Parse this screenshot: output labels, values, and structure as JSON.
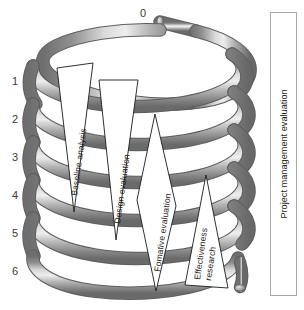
{
  "figure": {
    "background_color": "#ffffff",
    "coil": {
      "name": "helical-coil",
      "turns": 6,
      "tube_color_dark": "#6f6f6f",
      "tube_color_mid": "#9a9a9a",
      "tube_color_light": "#dcdcdc",
      "outline_color": "#5a5a5a"
    },
    "cycle_labels": [
      {
        "value": "0",
        "x": 140,
        "y": 8
      },
      {
        "value": "1",
        "x": 12,
        "y": 76
      },
      {
        "value": "2",
        "x": 12,
        "y": 114
      },
      {
        "value": "3",
        "x": 12,
        "y": 152
      },
      {
        "value": "4",
        "x": 12,
        "y": 190
      },
      {
        "value": "5",
        "x": 12,
        "y": 228
      },
      {
        "value": "6",
        "x": 12,
        "y": 266
      }
    ],
    "phases": [
      {
        "id": "baseline-analysis",
        "label": "Baseline analysis",
        "shape": "triangle"
      },
      {
        "id": "design-evaluation",
        "label": "Design evaluation",
        "shape": "triangle"
      },
      {
        "id": "formative-evaluation",
        "label": "Fomative evaluation",
        "shape": "diamond"
      },
      {
        "id": "effectiveness-research",
        "label": "Effectiveness",
        "label_line2": "research",
        "shape": "triangle"
      }
    ],
    "side_panel": {
      "label": "Project management evaluation",
      "border_color": "#a9a9a9"
    }
  }
}
